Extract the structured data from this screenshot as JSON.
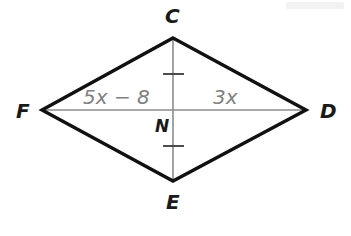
{
  "figure": {
    "type": "geometry-diagram",
    "shape": "rhombus",
    "background_color": "#ffffff",
    "side_color": "#111111",
    "diagonal_color": "#8c8c8c",
    "label_color": "#808080",
    "vertex_label_color": "#1a1a1a",
    "vertices": [
      {
        "name": "C",
        "label": "C",
        "x": 173,
        "y": 38
      },
      {
        "name": "D",
        "label": "D",
        "x": 306,
        "y": 110
      },
      {
        "name": "E",
        "label": "E",
        "x": 173,
        "y": 181
      },
      {
        "name": "F",
        "label": "F",
        "x": 42,
        "y": 110
      }
    ],
    "center": {
      "name": "N",
      "label": "N",
      "x": 173,
      "y": 110
    },
    "sides": [
      {
        "from": "C",
        "to": "D"
      },
      {
        "from": "D",
        "to": "E"
      },
      {
        "from": "E",
        "to": "F"
      },
      {
        "from": "F",
        "to": "C"
      }
    ],
    "diagonals": [
      {
        "from": "C",
        "to": "E",
        "orientation": "vertical"
      },
      {
        "from": "F",
        "to": "D",
        "orientation": "horizontal"
      }
    ],
    "tick_marks": [
      {
        "on_segment": "CN",
        "x": 173,
        "y": 74,
        "count": 1
      },
      {
        "on_segment": "NE",
        "x": 173,
        "y": 146,
        "count": 1
      }
    ],
    "segment_labels": [
      {
        "name": "FN",
        "text": "5x − 8",
        "variable_part": "5x",
        "constant_part": " − 8",
        "x": 83,
        "y": 87
      },
      {
        "name": "ND",
        "text": "3x",
        "variable_part": "3x",
        "constant_part": "",
        "x": 213,
        "y": 87
      }
    ]
  }
}
